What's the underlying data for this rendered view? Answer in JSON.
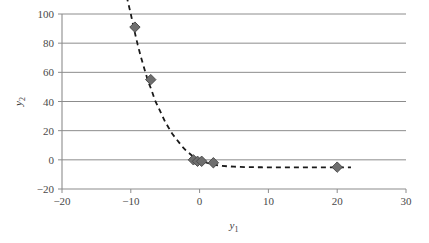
{
  "chart_data": {
    "type": "scatter",
    "title": "",
    "xlabel": "y1",
    "ylabel": "y2",
    "xlabel_base": "y",
    "xlabel_sub": "1",
    "ylabel_base": "y",
    "ylabel_sub": "2",
    "xlim": [
      -20,
      30
    ],
    "ylim": [
      -20,
      100
    ],
    "xticks": [
      -20,
      -10,
      0,
      10,
      20,
      30
    ],
    "xticklabels": [
      "−20",
      "−10",
      "0",
      "10",
      "20",
      "30"
    ],
    "yticks": [
      -20,
      0,
      20,
      40,
      60,
      80,
      100
    ],
    "yticklabels": [
      "−20",
      "0",
      "20",
      "40",
      "60",
      "80",
      "100"
    ],
    "grid": "horizontal",
    "legend": "none",
    "marker": "diamond",
    "marker_color": "#6e6e6e",
    "marker_edge_color": "#4d4d4d",
    "line_style": "dashed",
    "line_color": "#1a1a1a",
    "points": [
      {
        "x": -9.4,
        "y": 91
      },
      {
        "x": -7.1,
        "y": 55
      },
      {
        "x": -0.9,
        "y": 0
      },
      {
        "x": -0.3,
        "y": -1
      },
      {
        "x": 0.3,
        "y": -1
      },
      {
        "x": 2.0,
        "y": -2
      },
      {
        "x": 20.0,
        "y": -5
      }
    ],
    "fit_curve": {
      "description": "dashed exponential decay trend line",
      "x": [
        -10.6,
        -10.0,
        -9.5,
        -9.0,
        -8.5,
        -8.0,
        -7.5,
        -7.0,
        -6.5,
        -6.0,
        -5.5,
        -5.0,
        -4.5,
        -4.0,
        -3.5,
        -3.0,
        -2.5,
        -2.0,
        -1.5,
        -1.0,
        -0.5,
        0.0,
        1.0,
        2.0,
        3.0,
        4.0,
        5.0,
        7.0,
        9.0,
        11.0,
        13.0,
        15.0,
        17.0,
        19.0,
        21.0,
        22.0
      ],
      "y": [
        112,
        100,
        89,
        79,
        70,
        62,
        54,
        48,
        41,
        36,
        31,
        26,
        22,
        18,
        15,
        12,
        9,
        6.5,
        4.5,
        2.5,
        1.0,
        -0.3,
        -2.0,
        -3.2,
        -4.0,
        -4.4,
        -4.7,
        -5.0,
        -5.1,
        -5.2,
        -5.2,
        -5.2,
        -5.2,
        -5.2,
        -5.2,
        -5.2
      ]
    }
  },
  "axes": {
    "spine_color": "#8c8c8c",
    "grid_color": "#8c8c8c",
    "background": "#ffffff"
  }
}
